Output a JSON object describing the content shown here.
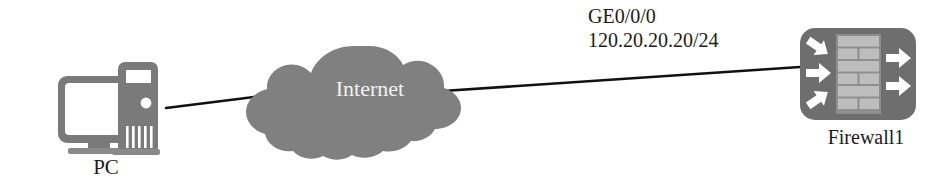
{
  "diagram": {
    "type": "network-topology",
    "background_color": "#ffffff",
    "nodes": [
      {
        "id": "pc",
        "icon": "desktop-computer-icon",
        "label": "PC",
        "color": "#7a7a7a"
      },
      {
        "id": "internet",
        "icon": "cloud-icon",
        "label": "Internet",
        "color": "#808080",
        "label_color": "#f2f2f2"
      },
      {
        "id": "firewall1",
        "icon": "firewall-brick-wall-icon",
        "label": "Firewall1",
        "color": "#6e6e6e",
        "brick_color": "#b8b8b8",
        "arrow_color": "#ffffff"
      }
    ],
    "links": [
      {
        "id": "pc-to-internet",
        "from": "pc",
        "to": "internet",
        "color": "#111111"
      },
      {
        "id": "internet-to-firewall1",
        "from": "internet",
        "to": "firewall1",
        "color": "#111111",
        "interface": "GE0/0/0",
        "ip_address": "120.20.20.20/24"
      }
    ]
  }
}
